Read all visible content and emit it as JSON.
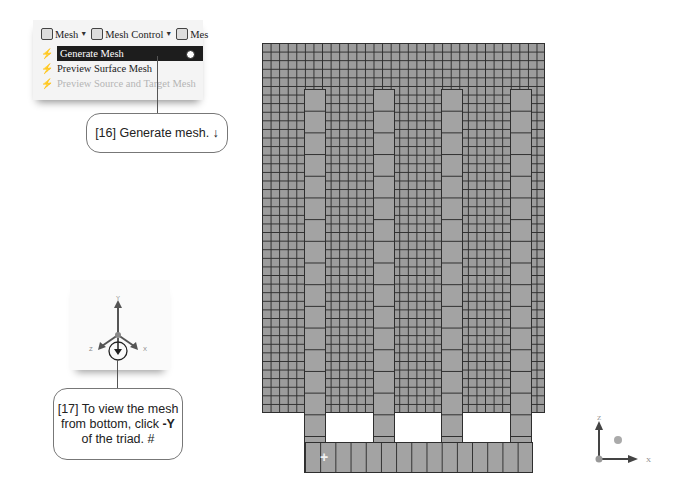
{
  "menu_snapshot": {
    "toolbar": [
      {
        "label": "Mesh",
        "icon": "mesh-icon",
        "has_dropdown": true
      },
      {
        "label": "Mesh Control",
        "icon": "mesh-control-icon",
        "has_dropdown": true
      },
      {
        "label": "Mes",
        "icon": "mesh-icon",
        "has_dropdown": false
      }
    ],
    "items": [
      {
        "label": "Generate Mesh",
        "icon": "generate-mesh-icon",
        "state": "selected"
      },
      {
        "label": "Preview Surface Mesh",
        "icon": "preview-surface-mesh-icon",
        "state": "normal"
      },
      {
        "label": "Preview Source and Target Mesh",
        "icon": "preview-source-target-icon",
        "state": "disabled"
      }
    ]
  },
  "callouts": {
    "step16": {
      "number": "[16]",
      "text": "Generate mesh.",
      "symbol": "↓"
    },
    "step17": {
      "number": "[17]",
      "line1": "To view the mesh",
      "line2": "from bottom, click ",
      "bold": "-Y",
      "line3": "of the triad.",
      "symbol": "#"
    }
  },
  "triad_snapshot": {
    "axes": [
      "Y",
      "Z",
      "X"
    ],
    "highlight": "-Y"
  },
  "mesh_view": {
    "fill_color": "#9c9c9c",
    "line_color": "#2e2e2e",
    "columns": 4
  },
  "global_triad": {
    "axes": [
      "Z",
      "X"
    ]
  }
}
